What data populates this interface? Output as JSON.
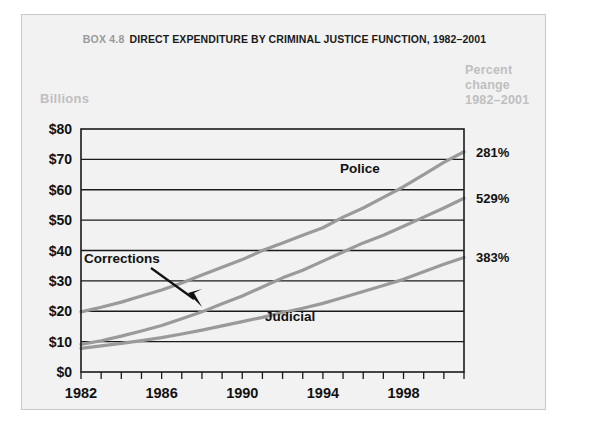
{
  "title": {
    "box_number": "BOX 4.8",
    "text": "DIRECT EXPENDITURE BY CRIMINAL JUSTICE FUNCTION, 1982–2001"
  },
  "axes": {
    "y_axis_title": "Billions",
    "y_ticks": [
      "$0",
      "$10",
      "$20",
      "$30",
      "$40",
      "$50",
      "$60",
      "$70",
      "$80"
    ],
    "x_ticks_labeled": [
      "1982",
      "1986",
      "1990",
      "1994",
      "1998"
    ]
  },
  "right_panel": {
    "header_line1": "Percent",
    "header_line2": "change",
    "header_line3": "1982–2001",
    "values": [
      {
        "series": "Police",
        "label": "281%"
      },
      {
        "series": "Corrections",
        "label": "529%"
      },
      {
        "series": "Judicial",
        "label": "383%"
      }
    ]
  },
  "series_labels": {
    "police": "Police",
    "corrections": "Corrections",
    "judicial": "Judicial"
  },
  "chart_data": {
    "type": "line",
    "xlabel": "",
    "ylabel": "Billions",
    "xlim": [
      1982,
      2001
    ],
    "ylim": [
      0,
      80
    ],
    "grid": true,
    "legend_position": "inline-annotations",
    "x": [
      1982,
      1983,
      1984,
      1985,
      1986,
      1987,
      1988,
      1989,
      1990,
      1991,
      1992,
      1993,
      1994,
      1995,
      1996,
      1997,
      1998,
      1999,
      2000,
      2001
    ],
    "series": [
      {
        "name": "Police",
        "percent_change_1982_2001": "281%",
        "values": [
          19.8,
          21.3,
          23.0,
          25.0,
          27.0,
          29.3,
          31.9,
          34.5,
          37.0,
          40.0,
          42.5,
          45.0,
          47.5,
          51.0,
          54.0,
          57.5,
          61.0,
          65.0,
          69.0,
          72.5
        ]
      },
      {
        "name": "Corrections",
        "percent_change_1982_2001": "529%",
        "values": [
          9.1,
          10.3,
          11.8,
          13.5,
          15.3,
          17.5,
          19.8,
          22.5,
          25.0,
          28.0,
          31.0,
          33.5,
          36.5,
          39.5,
          42.5,
          45.0,
          48.0,
          51.0,
          54.0,
          57.2
        ]
      },
      {
        "name": "Judicial",
        "percent_change_1982_2001": "383%",
        "values": [
          7.8,
          8.6,
          9.4,
          10.3,
          11.3,
          12.5,
          13.8,
          15.2,
          16.6,
          18.0,
          19.6,
          21.0,
          22.6,
          24.5,
          26.5,
          28.5,
          30.5,
          33.0,
          35.5,
          37.7
        ]
      }
    ]
  },
  "colors": {
    "figure_background": "#f2f2f2",
    "line_color": "#9a9a9a",
    "axis_color": "#1a1a1a",
    "muted_text": "#bfbfbf"
  }
}
